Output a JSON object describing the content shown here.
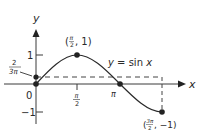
{
  "figure": {
    "function_label": "y = sin x",
    "axis_labels": {
      "x": "x",
      "y": "y"
    },
    "origin_label": "0",
    "y_ticks": [
      {
        "label": "1",
        "value": 1
      },
      {
        "label": "−1",
        "value": -1
      }
    ],
    "x_ticks": [
      {
        "label_num": "π",
        "label_den": "2",
        "value": "π/2"
      },
      {
        "label": "π",
        "value": "π"
      }
    ],
    "points": [
      {
        "label": "(π/2, 1)",
        "num": "π",
        "den": "2",
        "y": "1"
      },
      {
        "label": "(3π/2, −1)",
        "num": "3π",
        "den": "2",
        "y": "−1"
      }
    ],
    "intercept_label": {
      "num": "2",
      "den": "3π"
    },
    "colors": {
      "ink": "#2a2a2a",
      "background": "#ffffff"
    }
  }
}
